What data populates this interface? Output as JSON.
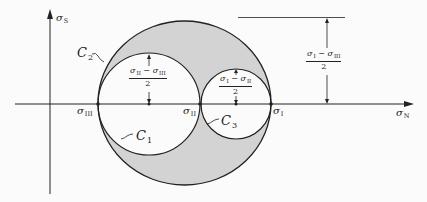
{
  "diagram": {
    "type": "mohr-circle",
    "axes": {
      "horizontal_label": "σ",
      "horizontal_sub": "N",
      "vertical_label": "σ",
      "vertical_sub": "S"
    },
    "points": {
      "s3": {
        "sym": "σ",
        "sub": "III"
      },
      "s2": {
        "sym": "σ",
        "sub": "II"
      },
      "s1": {
        "sym": "σ",
        "sub": "I"
      }
    },
    "circles": {
      "c1": {
        "sym": "C",
        "sub": "1"
      },
      "c2": {
        "sym": "C",
        "sub": "2"
      },
      "c3": {
        "sym": "C",
        "sub": "3"
      }
    },
    "radii_labels": {
      "r1": {
        "num_a": "σ",
        "num_a_sub": "II",
        "minus": " − ",
        "num_b": "σ",
        "num_b_sub": "III",
        "den": "2"
      },
      "r3": {
        "num_a": "σ",
        "num_a_sub": "I",
        "minus": " − ",
        "num_b": "σ",
        "num_b_sub": "II",
        "den": "2"
      },
      "r2": {
        "num_a": "σ",
        "num_a_sub": "I",
        "minus": " − ",
        "num_b": "σ",
        "num_b_sub": "III",
        "den": "2"
      }
    },
    "colors": {
      "shade": "#d3d3d3",
      "line": "#222222",
      "background": "#fbfbfb"
    }
  }
}
